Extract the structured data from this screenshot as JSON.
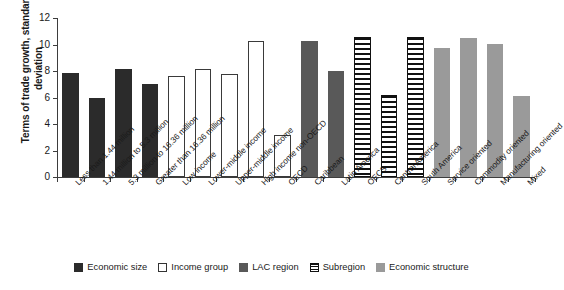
{
  "chart_data": {
    "type": "bar",
    "title": "",
    "xlabel": "",
    "ylabel": "Terms of trade growth, standard deviation",
    "ylim": [
      0,
      12
    ],
    "yticks": [
      0,
      2,
      4,
      6,
      8,
      10,
      12
    ],
    "grid": false,
    "legend_position": "bottom",
    "categories": [
      "Less than 1.44 million",
      "1.44 million to 5.3 million",
      "5.3 million to 16.36 million",
      "Greater than 16.36 million",
      "Low income",
      "Lower-middle income",
      "Upper-middle income",
      "High income non-OECD",
      "OECD",
      "Caribbean",
      "Latin America",
      "OECS",
      "Central America",
      "South America",
      "Service oriented",
      "Commodity oriented",
      "Manufacturing oriented",
      "Mixed"
    ],
    "values": [
      7.85,
      6.0,
      8.15,
      7.0,
      7.65,
      8.15,
      7.75,
      10.3,
      3.2,
      10.3,
      8.0,
      10.55,
      6.2,
      10.55,
      9.75,
      10.5,
      10.05,
      6.1
    ],
    "groups": [
      "economic-size",
      "economic-size",
      "economic-size",
      "economic-size",
      "income-group",
      "income-group",
      "income-group",
      "income-group",
      "income-group",
      "lac-region",
      "lac-region",
      "subregion",
      "subregion",
      "subregion",
      "economic-structure",
      "economic-structure",
      "economic-structure",
      "economic-structure"
    ],
    "legend": [
      {
        "key": "economic-size",
        "label": "Economic size",
        "color": "#2b2b2b"
      },
      {
        "key": "income-group",
        "label": "Income group",
        "color": "#ffffff"
      },
      {
        "key": "lac-region",
        "label": "LAC region",
        "color": "#595959"
      },
      {
        "key": "subregion",
        "label": "Subregion",
        "color": "#111111"
      },
      {
        "key": "economic-structure",
        "label": "Economic structure",
        "color": "#9a9a9a"
      }
    ]
  },
  "axis": {
    "y_title": "Terms of trade growth, standard deviation",
    "tick_0": "0",
    "tick_2": "2",
    "tick_4": "4",
    "tick_6": "6",
    "tick_8": "8",
    "tick_10": "10",
    "tick_12": "12"
  }
}
